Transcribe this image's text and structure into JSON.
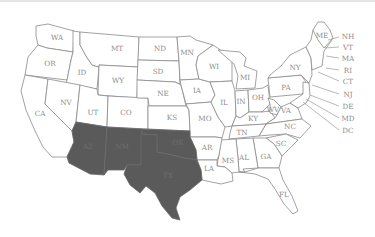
{
  "map": {
    "title": "",
    "shaded_color": "#5a5a5a",
    "shaded_states": [
      "AZ",
      "NM",
      "OK",
      "TX"
    ],
    "states": {
      "WA": "WA",
      "OR": "OR",
      "CA": "CA",
      "ID": "ID",
      "NV": "NV",
      "MT": "MT",
      "WY": "WY",
      "UT": "UT",
      "CO": "CO",
      "AZ": "AZ",
      "NM": "NM",
      "ND": "ND",
      "SD": "SD",
      "NE": "NE",
      "KS": "KS",
      "OK": "OK",
      "TX": "TX",
      "MN": "MN",
      "IA": "IA",
      "MO": "MO",
      "AR": "AR",
      "LA": "LA",
      "WI": "WI",
      "IL": "IL",
      "MI": "MI",
      "IN": "IN",
      "OH": "OH",
      "KY": "KY",
      "TN": "TN",
      "MS": "MS",
      "AL": "AL",
      "GA": "GA",
      "FL": "FL",
      "SC": "SC",
      "NC": "NC",
      "VA": "VA",
      "WV": "WV",
      "PA": "PA",
      "NY": "NY",
      "ME": "ME"
    },
    "callouts": [
      "NH",
      "VT",
      "MA",
      "RI",
      "CT",
      "NJ",
      "DE",
      "MD",
      "DC"
    ]
  }
}
